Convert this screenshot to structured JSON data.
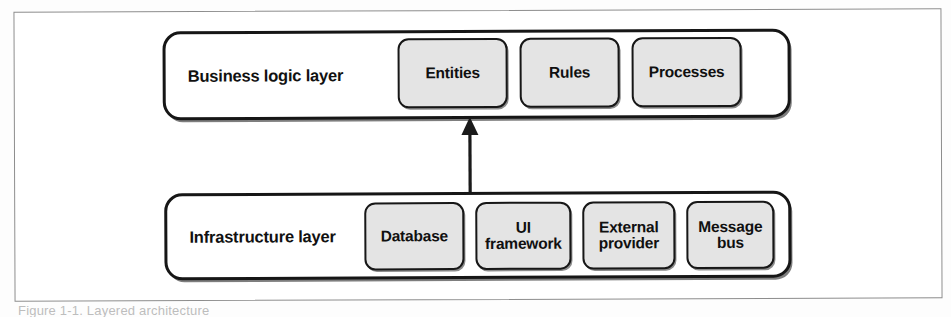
{
  "figure": {
    "type": "layered-architecture-diagram",
    "background_color": "#ffffff",
    "frame_color": "#8d8d8d",
    "box_fill_color": "#e4e4e4",
    "box_border_color": "#171717"
  },
  "layers": [
    {
      "id": "business-logic",
      "label": "Business logic layer",
      "components": [
        {
          "id": "entities",
          "label": "Entities"
        },
        {
          "id": "rules",
          "label": "Rules"
        },
        {
          "id": "processes",
          "label": "Processes"
        }
      ]
    },
    {
      "id": "infrastructure",
      "label": "Infrastructure layer",
      "components": [
        {
          "id": "database",
          "label": "Database"
        },
        {
          "id": "ui",
          "label": "UI\nframework"
        },
        {
          "id": "external",
          "label": "External\nprovider"
        },
        {
          "id": "message",
          "label": "Message\nbus"
        }
      ]
    }
  ],
  "connector": {
    "id": "infrastructure-to-entities",
    "direction": "up",
    "from": "infrastructure layer",
    "to": "Entities",
    "style": "solid-line-with-arrowhead",
    "color": "#1a1a1a"
  },
  "caption": {
    "text": "Figure 1-1. Layered architecture"
  }
}
